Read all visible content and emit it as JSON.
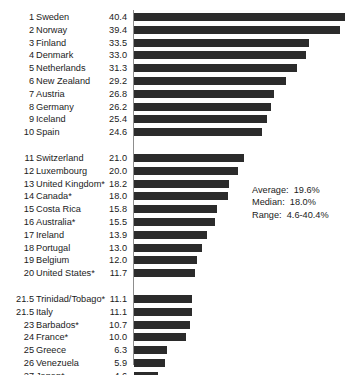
{
  "chart_data": {
    "type": "bar",
    "orientation": "horizontal",
    "title": "",
    "subtitle": "",
    "xlabel": "",
    "ylabel": "",
    "xlim": [
      0,
      42.5
    ],
    "grid": false,
    "legend": null,
    "bar_color": "#2b2b2b",
    "axis_color": "#8d8d8d",
    "text_color": "#1b1b1b",
    "categories": [
      "Sweden",
      "Norway",
      "Finland",
      "Denmark",
      "Netherlands",
      "New Zealand",
      "Austria",
      "Germany",
      "Iceland",
      "Spain",
      "Switzerland",
      "Luxembourg",
      "United Kingdom*",
      "Canada*",
      "Costa Rica",
      "Australia*",
      "Ireland",
      "Portugal",
      "Belgium",
      "United States*",
      "Trinidad/Tobago*",
      "Italy",
      "Barbados*",
      "France*",
      "Greece",
      "Venezuela",
      "Japan*"
    ],
    "values": [
      40.4,
      39.4,
      33.5,
      33.0,
      31.3,
      29.2,
      26.8,
      26.2,
      25.4,
      24.6,
      21.0,
      20.0,
      18.2,
      18.0,
      15.8,
      15.5,
      13.9,
      13.0,
      12.0,
      11.7,
      11.1,
      11.1,
      10.7,
      10.0,
      6.3,
      5.9,
      4.6
    ],
    "ranks": [
      "1",
      "2",
      "3",
      "4",
      "5",
      "6",
      "7",
      "8",
      "9",
      "10",
      "11",
      "12",
      "13",
      "14",
      "15",
      "16",
      "17",
      "18",
      "19",
      "20",
      "21.5",
      "21.5",
      "23",
      "24",
      "25",
      "26",
      "27"
    ],
    "value_labels": [
      "40.4",
      "39.4",
      "33.5",
      "33.0",
      "31.3",
      "29.2",
      "26.8",
      "26.2",
      "25.4",
      "24.6",
      "21.0",
      "20.0",
      "18.2",
      "18.0",
      "15.8",
      "15.5",
      "13.9",
      "13.0",
      "12.0",
      "11.7",
      "11.1",
      "11.1",
      "10.7",
      "10.0",
      "6.3",
      "5.9",
      "4.6"
    ],
    "group_breaks": [
      10,
      20
    ],
    "annotations": {
      "average": "Average:  19.6%",
      "median": "Median:  18.0%",
      "range": "Range:  4.6-40.4%"
    }
  }
}
